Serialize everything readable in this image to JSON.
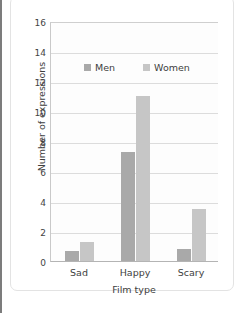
{
  "page": {
    "cutoff_heading": "",
    "background_color": "#ffffff",
    "card_border_color": "#e3e3e3",
    "rule_color": "#7c7c7c"
  },
  "legend": {
    "position": "inside-top-center",
    "items": [
      {
        "label": "Men",
        "color": "#a9a9a9"
      },
      {
        "label": "Women",
        "color": "#c6c6c6"
      }
    ]
  },
  "axes": {
    "y_title": "Number of expressions",
    "x_title": "Film type",
    "y_ticks": [
      "0",
      "2",
      "4",
      "6",
      "8",
      "10",
      "12",
      "14",
      "16"
    ],
    "x_ticks": [
      "Sad",
      "Happy",
      "Scary"
    ]
  },
  "chart_data": {
    "type": "bar",
    "title": "",
    "xlabel": "Film type",
    "ylabel": "Number of expressions",
    "categories": [
      "Sad",
      "Happy",
      "Scary"
    ],
    "series": [
      {
        "name": "Men",
        "color": "#a9a9a9",
        "values": [
          0.7,
          7.3,
          0.8
        ]
      },
      {
        "name": "Women",
        "color": "#c6c6c6",
        "values": [
          1.3,
          11.0,
          3.5
        ]
      }
    ],
    "ylim": [
      0,
      16
    ],
    "ytick_step": 2,
    "grid": true,
    "grid_axis": "y",
    "legend_position": "inside-top-center",
    "bar_mode": "grouped"
  }
}
